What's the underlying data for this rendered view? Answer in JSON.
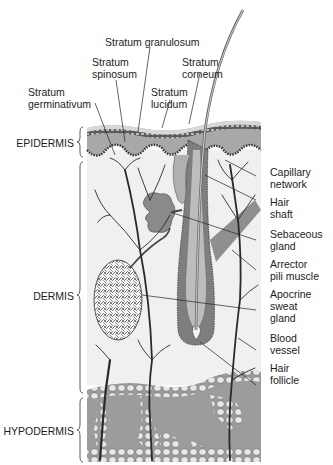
{
  "diagram": {
    "regions": [
      {
        "id": "epidermis",
        "label": "EPIDERMIS"
      },
      {
        "id": "dermis",
        "label": "DERMIS"
      },
      {
        "id": "hypodermis",
        "label": "HYPODERMIS"
      }
    ],
    "top_labels": [
      {
        "id": "stratum-granulosum",
        "line1": "Stratum granulosum",
        "line2": ""
      },
      {
        "id": "stratum-spinosum",
        "line1": "Stratum",
        "line2": "spinosum"
      },
      {
        "id": "stratum-corneum",
        "line1": "Stratum",
        "line2": "corneum"
      },
      {
        "id": "stratum-germinativum",
        "line1": "Stratum",
        "line2": "germinativum"
      },
      {
        "id": "stratum-lucidum",
        "line1": "Stratum",
        "line2": "lucidum"
      }
    ],
    "right_labels": [
      {
        "id": "capillary-network",
        "line1": "Capillary",
        "line2": "network",
        "line3": ""
      },
      {
        "id": "hair-shaft",
        "line1": "Hair",
        "line2": "shaft",
        "line3": ""
      },
      {
        "id": "sebaceous-gland",
        "line1": "Sebaceous",
        "line2": "gland",
        "line3": ""
      },
      {
        "id": "arrector-pili-muscle",
        "line1": "Arrector",
        "line2": "pili muscle",
        "line3": ""
      },
      {
        "id": "apocrine-sweat-gland",
        "line1": "Apocrine",
        "line2": "sweat",
        "line3": "gland"
      },
      {
        "id": "blood-vessel",
        "line1": "Blood",
        "line2": "vessel",
        "line3": ""
      },
      {
        "id": "hair-follicle",
        "line1": "Hair",
        "line2": "follicle",
        "line3": ""
      }
    ],
    "colors": {
      "epidermis": "#a9a9a9",
      "epidermis_dark": "#5e5e5e",
      "dermis": "#eeeeee",
      "hypodermis": "#9c9c9c",
      "fat_cells": "#e6e6e6",
      "vessel": "#2a2a2a",
      "follicle": "#8a8a8a"
    }
  }
}
